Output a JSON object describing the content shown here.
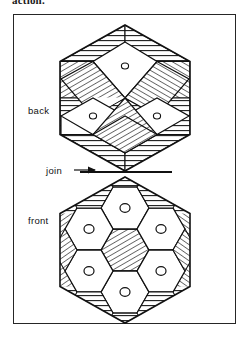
{
  "page": {
    "clipped_heading_text": "action.",
    "width": 252,
    "height": 339
  },
  "figure": {
    "frame": {
      "x": 13,
      "y": 14,
      "width": 223,
      "height": 310,
      "stroke": "#262626"
    },
    "labels": {
      "back": "back",
      "join": "join",
      "front": "front"
    },
    "colors": {
      "ink": "#111111",
      "frame": "#262626",
      "fill": "#ffffff",
      "hatch": "#1a1a1a"
    },
    "upper_shape": {
      "name": "back-hexagon",
      "description": "tumbling-blocks hexagon",
      "center_x": 125,
      "center_y": 98,
      "radius": 75,
      "white_rhombi_with_holes": 3,
      "hole_count": 3
    },
    "lower_shape": {
      "name": "front-hexagon",
      "description": "honeycomb hexagon",
      "center_x": 125,
      "center_y": 250,
      "radius": 75,
      "white_hexagons_with_holes": 6,
      "hatched_center_hexagons": 1,
      "hole_count": 6
    },
    "join": {
      "line_y": 172,
      "arrow_from_x": 74,
      "arrow_to_x": 96,
      "arrow_y": 170
    }
  }
}
